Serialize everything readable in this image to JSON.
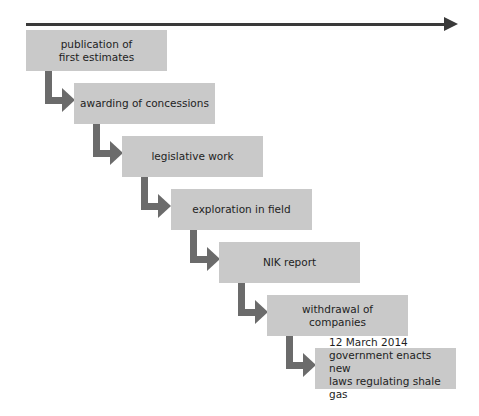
{
  "diagram": {
    "type": "staircase timeline",
    "colors": {
      "box": "#c9c9c9",
      "connector": "#6b6b6b",
      "timeline": "#3a3a3a",
      "text": "#1e1e1e"
    },
    "steps": [
      {
        "label": "publication of\nfirst estimates"
      },
      {
        "label": "awarding of concessions"
      },
      {
        "label": "legislative work"
      },
      {
        "label": "exploration in field"
      },
      {
        "label": "NIK report"
      },
      {
        "label": "withdrawal of companies"
      },
      {
        "label": "12 March 2014\ngovernment enacts new\nlaws regulating shale gas"
      }
    ]
  }
}
